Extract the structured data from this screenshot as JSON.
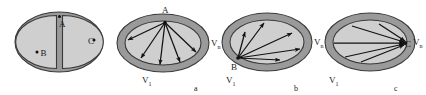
{
  "figure": {
    "name": "four-ellipse-graph-diagram",
    "background_color": "#ffffff",
    "ring_fill": "#9a9a9a",
    "interior_fill": "#cfcfcf",
    "outline_color": "#3a3a3a",
    "arrow_color": "#111111",
    "text_color": "#1a1a1a"
  },
  "panels": [
    {
      "id": "panel-0",
      "caption": "",
      "kind": "split-ellipse",
      "points": [
        {
          "name": "A",
          "label": "A",
          "position": "top-center"
        },
        {
          "name": "B",
          "label": "B",
          "position": "left-interior"
        },
        {
          "name": "C",
          "label": "C",
          "position": "right-edge"
        }
      ],
      "arrows": 0,
      "description": "ellipse ring divided by a vertical gap into two interior halves"
    },
    {
      "id": "panel-a",
      "caption": "a",
      "kind": "fan-from-apex",
      "apex": {
        "name": "A",
        "label": "A",
        "position": "top-center"
      },
      "vertex_labels": [
        {
          "name": "V1",
          "label": "V",
          "subscript": "1",
          "position": "lower-left"
        },
        {
          "name": "Vn",
          "label": "V",
          "subscript": "n",
          "position": "right"
        }
      ],
      "arrows": 5,
      "description": "five directed edges fan downward from apex A to the lower boundary"
    },
    {
      "id": "panel-b",
      "caption": "b",
      "kind": "fan-from-lower-left",
      "apex": {
        "name": "B",
        "label": "B",
        "position": "lower-left"
      },
      "vertex_labels": [
        {
          "name": "V1",
          "label": "V",
          "subscript": "1",
          "position": "lower-left"
        },
        {
          "name": "Vn",
          "label": "V",
          "subscript": "n",
          "position": "right"
        }
      ],
      "arrows": 5,
      "description": "five directed edges fan up and right from point B at the lower-left boundary"
    },
    {
      "id": "panel-c",
      "caption": "c",
      "kind": "converge-to-right",
      "apex": {
        "name": "C",
        "label": "C",
        "position": "right-edge"
      },
      "vertex_labels": [
        {
          "name": "V1",
          "label": "V",
          "subscript": "1",
          "position": "lower-left"
        },
        {
          "name": "Vn",
          "label": "V",
          "subscript": "n",
          "position": "right"
        }
      ],
      "arrows": 5,
      "description": "five directed edges converge to point C on the right boundary"
    }
  ],
  "captions": {
    "a": "a",
    "b": "b",
    "c": "c"
  },
  "labels": {
    "A": "A",
    "B": "B",
    "C": "C",
    "V": "V",
    "sub_1": "1",
    "sub_n": "n"
  }
}
